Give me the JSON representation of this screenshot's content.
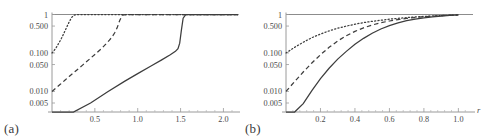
{
  "figure": {
    "background": "#ffffff",
    "curve_color": "#3d3d3d",
    "axis_color": "#9a9a9a"
  },
  "chart_data": [
    {
      "type": "line",
      "panel_label": "(a)",
      "title": "",
      "xlabel": "r",
      "ylabel": "",
      "yscale": "log",
      "xlim": [
        0.0,
        2.1
      ],
      "ylim": [
        0.003,
        1.15
      ],
      "grid": false,
      "legend": "none",
      "xticks": [
        0.5,
        1.0,
        1.5,
        2.0
      ],
      "xtick_labels": [
        "0.5",
        "1.0",
        "1.5",
        "2.0"
      ],
      "yticks": [
        1,
        0.5,
        0.1,
        0.05,
        0.01,
        0.005
      ],
      "ytick_labels": [
        "1",
        "0.500",
        "0.100",
        "0.050",
        "0.010",
        "0.005"
      ],
      "annotations": [
        "horizontal saturation line at y = 1"
      ],
      "series": [
        {
          "name": "dotted",
          "style": "dotted",
          "x": [
            0.0,
            0.02,
            0.05,
            0.08,
            0.11,
            0.14,
            0.17,
            0.2,
            0.23,
            0.26,
            0.3,
            0.4,
            0.7,
            1.0,
            1.5,
            2.0,
            2.1
          ],
          "y": [
            0.1,
            0.112,
            0.14,
            0.18,
            0.24,
            0.33,
            0.46,
            0.64,
            0.84,
            0.97,
            1.0,
            1.0,
            1.0,
            1.0,
            1.0,
            1.0,
            1.0
          ]
        },
        {
          "name": "dashed",
          "style": "dashed",
          "x": [
            0.0,
            0.05,
            0.1,
            0.15,
            0.2,
            0.28,
            0.36,
            0.44,
            0.52,
            0.58,
            0.63,
            0.67,
            0.7,
            0.73,
            0.76,
            0.79,
            0.82,
            0.9,
            1.2,
            1.6,
            2.0,
            2.1
          ],
          "y": [
            0.01,
            0.0125,
            0.0155,
            0.0195,
            0.0245,
            0.0345,
            0.049,
            0.07,
            0.1,
            0.132,
            0.172,
            0.215,
            0.26,
            0.33,
            0.45,
            0.7,
            0.965,
            1.0,
            1.0,
            1.0,
            1.0,
            1.0
          ]
        },
        {
          "name": "solid",
          "style": "solid",
          "x": [
            0.0,
            0.1,
            0.25,
            0.45,
            0.65,
            0.85,
            1.0,
            1.15,
            1.28,
            1.38,
            1.44,
            1.47,
            1.49,
            1.51,
            1.53,
            1.56,
            1.6,
            1.75,
            2.0,
            2.1
          ],
          "y": [
            0.0008,
            0.0013,
            0.0024,
            0.005,
            0.0098,
            0.0185,
            0.029,
            0.045,
            0.066,
            0.09,
            0.11,
            0.13,
            0.18,
            0.4,
            0.8,
            0.99,
            1.0,
            1.0,
            1.0,
            1.0
          ]
        }
      ]
    },
    {
      "type": "line",
      "panel_label": "(b)",
      "title": "",
      "xlabel": "r",
      "ylabel": "",
      "yscale": "log",
      "xlim": [
        0.0,
        1.05
      ],
      "ylim": [
        0.003,
        1.15
      ],
      "grid": false,
      "legend": "none",
      "xticks": [
        0.2,
        0.4,
        0.6,
        0.8,
        1.0
      ],
      "xtick_labels": [
        "0.2",
        "0.4",
        "0.6",
        "0.8",
        "1.0"
      ],
      "yticks": [
        1,
        0.5,
        0.1,
        0.05,
        0.01,
        0.005
      ],
      "ytick_labels": [
        "1",
        "0.500",
        "0.100",
        "0.050",
        "0.010",
        "0.005"
      ],
      "annotations": [
        "horizontal asymptote line at y = 1"
      ],
      "series": [
        {
          "name": "dotted",
          "style": "dotted",
          "x": [
            0.0,
            0.05,
            0.1,
            0.15,
            0.2,
            0.25,
            0.3,
            0.35,
            0.4,
            0.45,
            0.5,
            0.55,
            0.6,
            0.65,
            0.7,
            0.75,
            0.8,
            0.85,
            0.9,
            0.95,
            1.0
          ],
          "y": [
            0.1,
            0.14,
            0.19,
            0.25,
            0.31,
            0.375,
            0.44,
            0.5,
            0.56,
            0.615,
            0.665,
            0.71,
            0.755,
            0.795,
            0.83,
            0.862,
            0.89,
            0.915,
            0.938,
            0.958,
            0.975
          ]
        },
        {
          "name": "dashed",
          "style": "dashed",
          "x": [
            0.0,
            0.05,
            0.1,
            0.15,
            0.2,
            0.25,
            0.3,
            0.35,
            0.4,
            0.45,
            0.5,
            0.55,
            0.6,
            0.65,
            0.7,
            0.75,
            0.8,
            0.85,
            0.9,
            0.95,
            1.0
          ],
          "y": [
            0.01,
            0.018,
            0.032,
            0.055,
            0.09,
            0.14,
            0.205,
            0.28,
            0.365,
            0.45,
            0.535,
            0.61,
            0.678,
            0.738,
            0.79,
            0.835,
            0.874,
            0.906,
            0.933,
            0.956,
            0.974
          ]
        },
        {
          "name": "solid",
          "style": "solid",
          "x": [
            0.0,
            0.05,
            0.1,
            0.15,
            0.2,
            0.25,
            0.3,
            0.35,
            0.4,
            0.45,
            0.5,
            0.55,
            0.6,
            0.65,
            0.7,
            0.75,
            0.8,
            0.85,
            0.9,
            0.95,
            1.0
          ],
          "y": [
            0.0008,
            0.002,
            0.0048,
            0.0105,
            0.0215,
            0.04,
            0.069,
            0.11,
            0.168,
            0.24,
            0.326,
            0.42,
            0.515,
            0.605,
            0.69,
            0.76,
            0.82,
            0.87,
            0.91,
            0.945,
            0.972
          ]
        }
      ]
    }
  ]
}
